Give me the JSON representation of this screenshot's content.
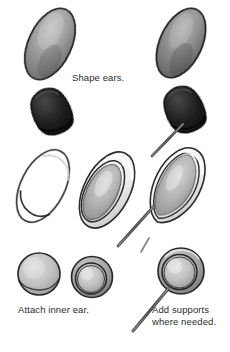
{
  "page": {
    "background_color": "#ffffff",
    "width": 230,
    "height": 352,
    "medium": "pencil-shaded instructional line drawing"
  },
  "captions": [
    {
      "id": "shape-ears",
      "text": "Shape ears.",
      "x": 72,
      "y": 75,
      "color": "#2f2f2f"
    },
    {
      "id": "attach-inner-ear",
      "text": "Attach inner ear.",
      "x": 18,
      "y": 307,
      "color": "#2f2f2f"
    },
    {
      "id": "add-supports",
      "text": "Add supports\nwhere needed.",
      "x": 152,
      "y": 307,
      "color": "#2f2f2f"
    }
  ],
  "palette": {
    "outline": "#262626",
    "dark_fill": "#1f1f1f",
    "mid_gray": "#9a9a9a",
    "light_gray": "#d2d2d2",
    "paper": "#ffffff",
    "wire": "#6e6e6e"
  },
  "rows": [
    {
      "id": "row-1-ovals",
      "label": "Row 1 — shaded ovals",
      "figures": [
        {
          "id": "oval-left",
          "shape": "shaded-oval",
          "cx": 50,
          "cy": 44,
          "rx": 21,
          "ry": 38,
          "rotate": 25,
          "tone": "#9e9e9e"
        },
        {
          "id": "oval-right",
          "shape": "shaded-oval",
          "cx": 181,
          "cy": 43,
          "rx": 21,
          "ry": 37,
          "rotate": 25,
          "tone": "#8d8d8d"
        }
      ]
    },
    {
      "id": "row-2-cones",
      "label": "Row 2 — dark clay cones",
      "figures": [
        {
          "id": "cone-left",
          "shape": "dark-cone",
          "cx": 52,
          "cy": 112,
          "rotate": -18,
          "tone": "#1c1c1c",
          "has_wire": false
        },
        {
          "id": "cone-right",
          "shape": "dark-cone",
          "cx": 185,
          "cy": 110,
          "rotate": -18,
          "tone": "#1c1c1c",
          "has_wire": true,
          "wire": {
            "x1": 183,
            "y1": 124,
            "x2": 152,
            "y2": 156
          }
        }
      ]
    },
    {
      "id": "row-3-ears",
      "label": "Row 3 — outlined ear shapes",
      "figures": [
        {
          "id": "ear-outline",
          "shape": "open-oval",
          "cx": 43,
          "cy": 186,
          "rx": 22,
          "ry": 39,
          "rotate": 27,
          "tone": "#ffffff",
          "has_inner": false,
          "has_wire": false
        },
        {
          "id": "ear-with-inner",
          "shape": "oval-with-inner",
          "cx": 107,
          "cy": 190,
          "rx": 23,
          "ry": 41,
          "rotate": 27,
          "tone": "#b7b7b7",
          "has_inner": true,
          "has_wire": false
        },
        {
          "id": "ear-with-support",
          "shape": "pointed-oval",
          "cx": 177,
          "cy": 186,
          "rx": 23,
          "ry": 41,
          "rotate": 27,
          "tone": "#b9b9b9",
          "has_inner": true,
          "has_wire": true,
          "wire": {
            "x1": 154,
            "y1": 206,
            "x2": 118,
            "y2": 246
          }
        }
      ]
    },
    {
      "id": "row-4-discs",
      "label": "Row 4 — inner ear discs",
      "figures": [
        {
          "id": "disc-plain",
          "shape": "disc",
          "cx": 39,
          "cy": 274,
          "r": 21,
          "tone": "#c9c9c9",
          "has_inner": false,
          "has_wire": false
        },
        {
          "id": "disc-with-inner",
          "shape": "disc-with-inner",
          "cx": 92,
          "cy": 277,
          "r": 20,
          "tone": "#c4c4c4",
          "has_inner": true,
          "has_wire": false
        },
        {
          "id": "disc-with-support",
          "shape": "disc-with-inner",
          "cx": 181,
          "cy": 271,
          "r": 23,
          "tone": "#c8c8c8",
          "has_inner": true,
          "has_wire": true,
          "wire": {
            "x1": 168,
            "y1": 289,
            "x2": 133,
            "y2": 331
          }
        }
      ]
    }
  ],
  "stray_marks": [
    {
      "id": "stray-wire-top-right",
      "x1": 149,
      "y1": 238,
      "x2": 140,
      "y2": 252
    }
  ]
}
